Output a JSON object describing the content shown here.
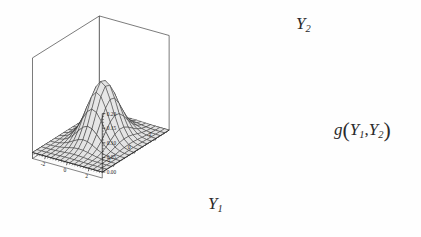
{
  "figure": {
    "type": "surface3d",
    "background_color": "#fefefe",
    "line_color": "#1d1d1d",
    "surface_light": "#e9e9e9",
    "surface_dark": "#6f6f6f",
    "shadow_color": "#0d0d0d"
  },
  "labels": {
    "y2_axis": "Y",
    "y2_sub": "2",
    "y1_axis": "Y",
    "y1_sub": "1",
    "g_main": "g",
    "g_open": "(",
    "g_y_a": "Y",
    "g_sub_a": "1",
    "g_comma": ",",
    "g_y_b": "Y",
    "g_sub_b": "2",
    "g_close": ")"
  },
  "chart_data": {
    "type": "surface",
    "title": "",
    "xlabel": "Y1",
    "ylabel": "Y2",
    "zlabel": "g(Y1,Y2)",
    "grid": true,
    "legend": "none",
    "xlim": [
      -3.2,
      3.2
    ],
    "ylim": [
      -3.2,
      3.2
    ],
    "zlim": [
      0.0,
      0.2
    ],
    "x_ticks": [
      -2,
      0,
      2
    ],
    "x_tick_labels": [
      "-2",
      "0",
      "2"
    ],
    "y_ticks": [
      2,
      0,
      -2
    ],
    "y_tick_labels": [
      "2",
      "0",
      "-2"
    ],
    "z_ticks": [
      0.2,
      0.15,
      0.1,
      0.05,
      0.0
    ],
    "z_tick_labels": [
      "0.20",
      "0.15",
      "0.10",
      "0.05",
      "0.00"
    ],
    "z_minor_count": 4,
    "mesh_n": 15,
    "surface_model": "bivariate_normal",
    "peak_value": 0.2,
    "peak_x": -0.15,
    "peak_y": 0.35,
    "sigma_x": 1.0,
    "sigma_y": 1.0,
    "rho": 0.0
  },
  "ticks": {
    "z": [
      "0.20",
      "0.15",
      "0.10",
      "0.05",
      "0.00"
    ],
    "y1": [
      "-2",
      "0",
      "2"
    ],
    "y2": [
      "2",
      "0",
      "-2"
    ]
  }
}
